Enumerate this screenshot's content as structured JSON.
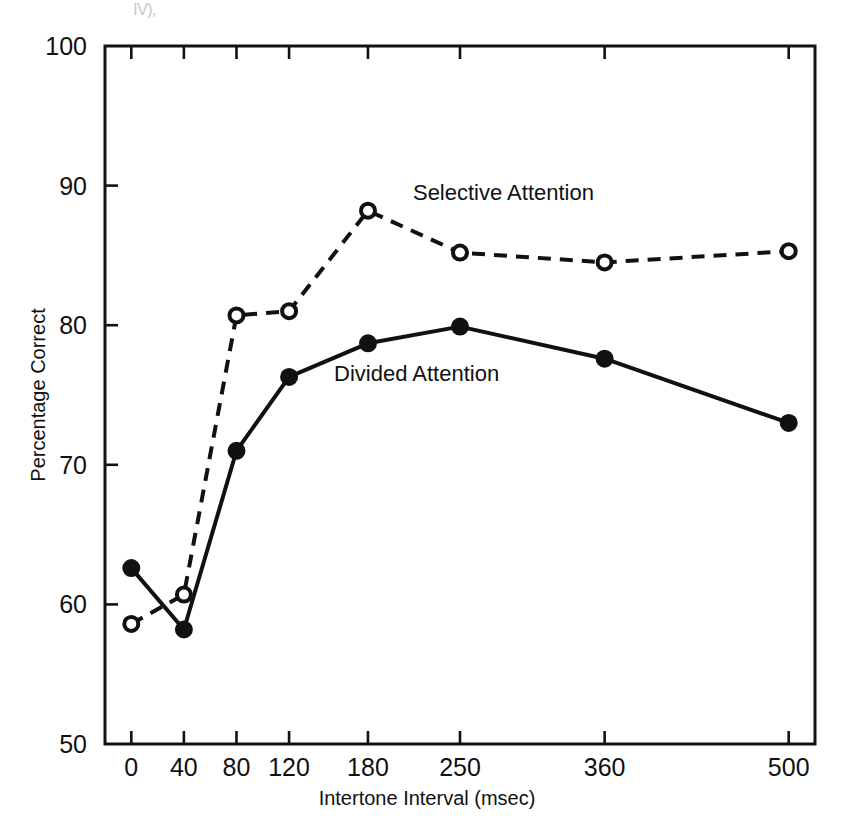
{
  "figure": {
    "artifact_text": "IV),"
  },
  "chart_data": {
    "type": "line",
    "title": "",
    "xlabel": "Intertone Interval (msec)",
    "ylabel": "Percentage Correct",
    "x": [
      0,
      40,
      80,
      120,
      180,
      250,
      360,
      500
    ],
    "xtick_labels": [
      "0",
      "40",
      "80",
      "120",
      "180",
      "250",
      "360",
      "500"
    ],
    "xlim": [
      -20,
      520
    ],
    "ylim": [
      50,
      100
    ],
    "ytick_labels": [
      "50",
      "60",
      "70",
      "80",
      "90",
      "100"
    ],
    "yticks": [
      50,
      60,
      70,
      80,
      90,
      100
    ],
    "grid": false,
    "legend_position": "inline-annotations",
    "series": [
      {
        "name": "Selective Attention",
        "marker": "open-circle",
        "line_style": "dashed",
        "color": "#111111",
        "values": [
          58.6,
          60.7,
          80.7,
          81.0,
          88.2,
          85.2,
          84.5,
          85.3
        ],
        "annotation": "Selective Attention"
      },
      {
        "name": "Divided Attention",
        "marker": "filled-circle",
        "line_style": "solid",
        "color": "#111111",
        "values": [
          62.6,
          58.2,
          71.0,
          76.3,
          78.7,
          79.9,
          77.6,
          73.0
        ],
        "annotation": "Divided Attention"
      }
    ],
    "annotations": [
      {
        "text": "Selective Attention",
        "x": 180,
        "y": 89.5
      },
      {
        "text": "Divided Attention",
        "x": 120,
        "y": 76.5
      }
    ]
  }
}
